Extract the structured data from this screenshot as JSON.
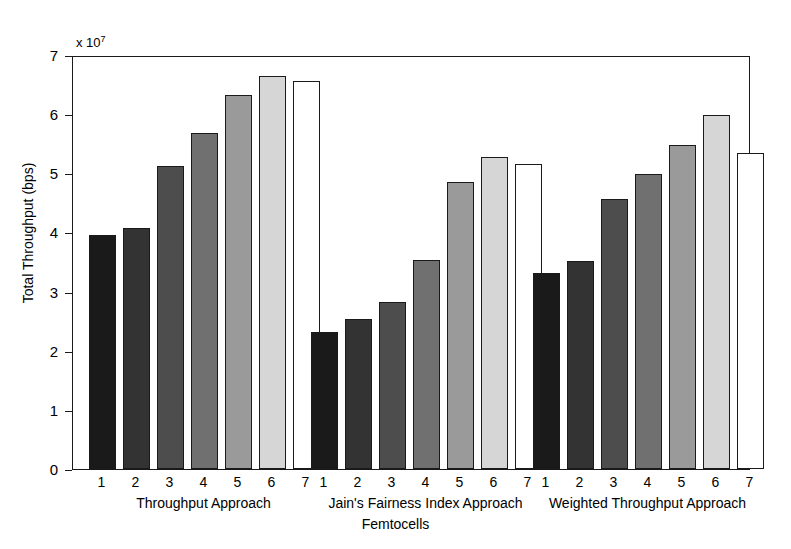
{
  "chart_data": {
    "type": "bar",
    "title": "",
    "xlabel": "Femtocells",
    "ylabel": "Total Throughput (bps)",
    "y_exponent_label": "x 10",
    "y_exponent_power": "7",
    "y_multiplier": 10000000,
    "ylim": [
      0,
      70000000
    ],
    "y_ticks": [
      0,
      1,
      2,
      3,
      4,
      5,
      6,
      7
    ],
    "y_tick_labels": [
      "0",
      "1",
      "2",
      "3",
      "4",
      "5",
      "6",
      "7"
    ],
    "grid": false,
    "legend": "none",
    "categories": [
      "1",
      "2",
      "3",
      "4",
      "5",
      "6",
      "7"
    ],
    "category_axis_label": "Femtocells",
    "groups": [
      {
        "name": "Throughput Approach",
        "label": "Throughput Approach",
        "values": [
          3.96,
          4.08,
          5.12,
          5.68,
          6.32,
          6.65,
          6.56
        ]
      },
      {
        "name": "Jain's Fairness Index Approach",
        "label": "Jain's Fairness Index Approach",
        "values": [
          2.32,
          2.53,
          2.83,
          3.53,
          4.85,
          5.28,
          5.16
        ]
      },
      {
        "name": "Weighted Throughput Approach",
        "label": "Weighted Throughput Approach",
        "values": [
          3.31,
          3.52,
          4.57,
          4.99,
          5.48,
          5.98,
          5.34
        ]
      }
    ],
    "bar_colors": [
      "#1a1a1a",
      "#333333",
      "#4d4d4d",
      "#707070",
      "#9a9a9a",
      "#d6d6d6",
      "#ffffff"
    ],
    "bar_edge_color": "#1a1a1a",
    "axis_color": "#1a1a1a",
    "background_color": "#ffffff"
  }
}
